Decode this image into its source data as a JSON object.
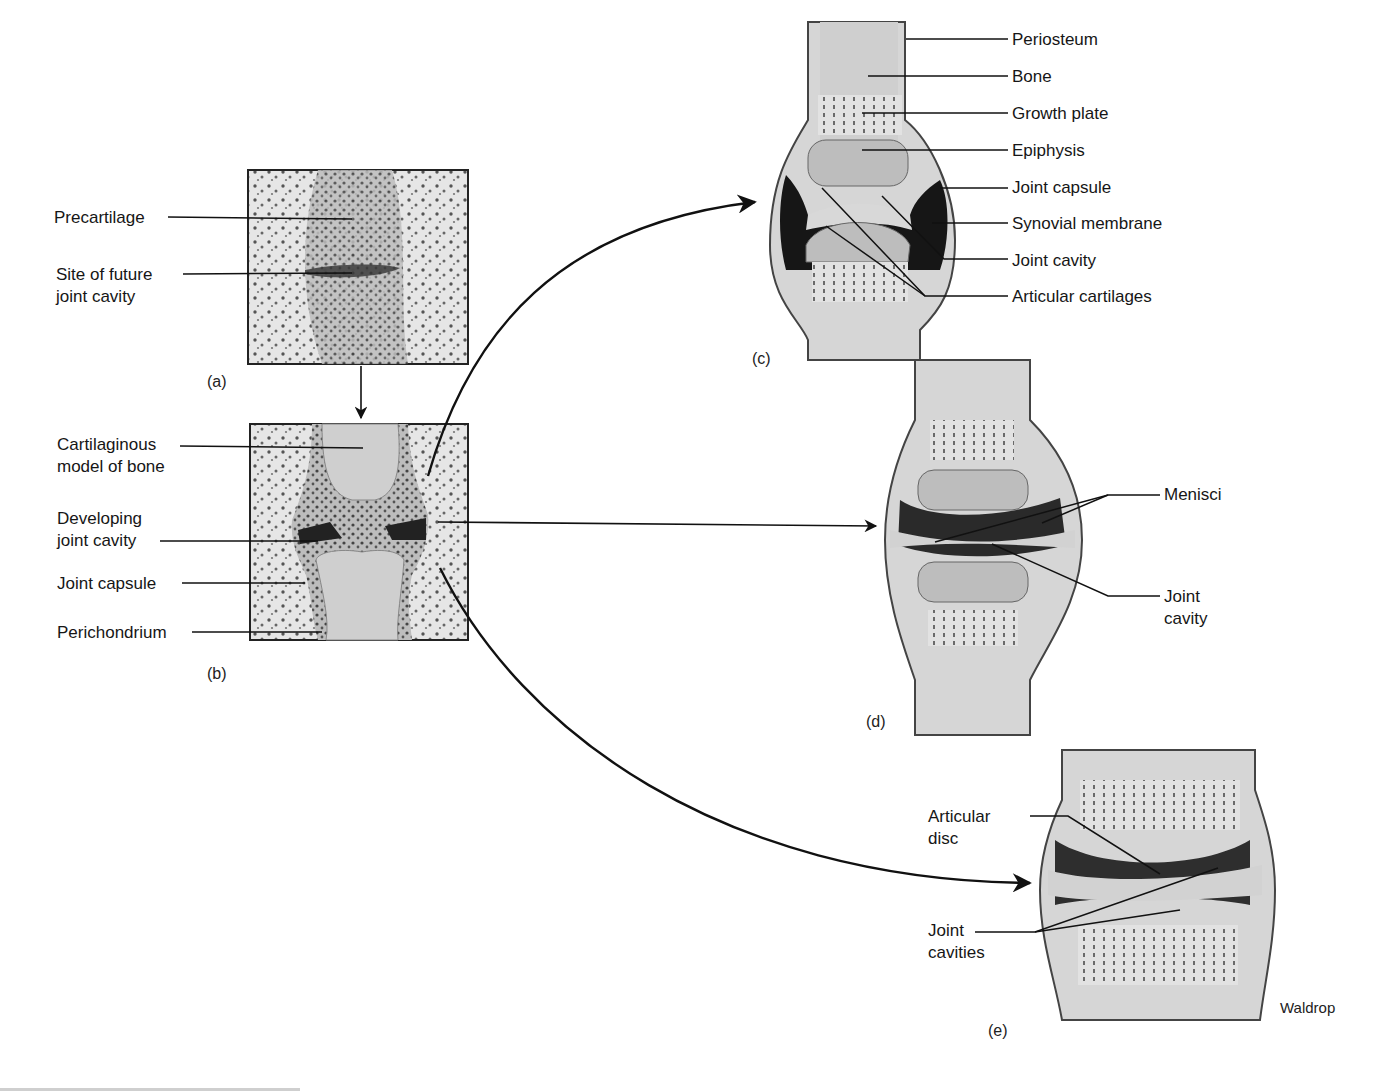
{
  "figure": {
    "credit": "Waldrop",
    "colors": {
      "ink": "#161616",
      "cartilage": "#c9c9c9",
      "cavity": "#1e1e1e",
      "tissue": "#d8d8d8",
      "background": "#ffffff"
    }
  },
  "panels": {
    "a": {
      "tag": "(a)",
      "labels": [
        "Precartilage",
        "Site of future\njoint cavity"
      ]
    },
    "b": {
      "tag": "(b)",
      "labels": [
        "Cartilaginous\nmodel of bone",
        "Developing\njoint cavity",
        "Joint capsule",
        "Perichondrium"
      ]
    },
    "c": {
      "tag": "(c)",
      "labels": [
        "Periosteum",
        "Bone",
        "Growth plate",
        "Epiphysis",
        "Joint capsule",
        "Synovial membrane",
        "Joint cavity",
        "Articular cartilages"
      ]
    },
    "d": {
      "tag": "(d)",
      "labels": [
        "Menisci",
        "Joint\ncavity"
      ]
    },
    "e": {
      "tag": "(e)",
      "labels": [
        "Articular\ndisc",
        "Joint\ncavities"
      ]
    }
  }
}
